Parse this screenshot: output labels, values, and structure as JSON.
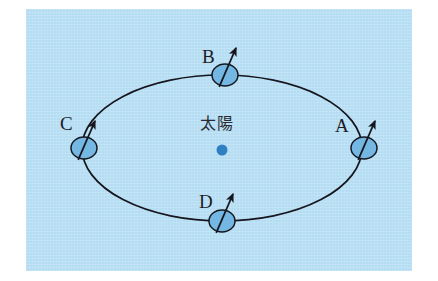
{
  "figure": {
    "background_color": "#b4ddf3",
    "page_color": "#ffffff",
    "stroke_color": "#16161e",
    "planet_fill": "#74b7e2",
    "sun_color": "#2e7fc4"
  },
  "center": {
    "sun_label": "太陽",
    "sun_label_x": 222,
    "sun_label_y": 126,
    "sun_dot_x": 222,
    "sun_dot_y": 150,
    "sun_dot_r": 5.5
  },
  "orbit": {
    "center_x": 222,
    "center_y": 148,
    "radius_x": 140,
    "radius_y": 73,
    "stroke_width": 1.7
  },
  "positions": [
    {
      "id": "A",
      "label": "A",
      "label_x": 335,
      "label_y": 116,
      "planet_x": 364,
      "planet_y": 148,
      "planet_rx": 13,
      "planet_ry": 11,
      "axis_tilt_deg": 23.4,
      "arrow_len": 26
    },
    {
      "id": "B",
      "label": "B",
      "label_x": 202,
      "label_y": 47,
      "planet_x": 225,
      "planet_y": 75,
      "planet_rx": 13,
      "planet_ry": 11,
      "axis_tilt_deg": 23.4,
      "arrow_len": 26
    },
    {
      "id": "C",
      "label": "C",
      "label_x": 60,
      "label_y": 114,
      "planet_x": 84,
      "planet_y": 148,
      "planet_rx": 13,
      "planet_ry": 11,
      "axis_tilt_deg": 23.4,
      "arrow_len": 26
    },
    {
      "id": "D",
      "label": "D",
      "label_x": 199,
      "label_y": 192,
      "planet_x": 222,
      "planet_y": 221,
      "planet_rx": 13,
      "planet_ry": 11,
      "axis_tilt_deg": 23.4,
      "arrow_len": 26
    }
  ]
}
